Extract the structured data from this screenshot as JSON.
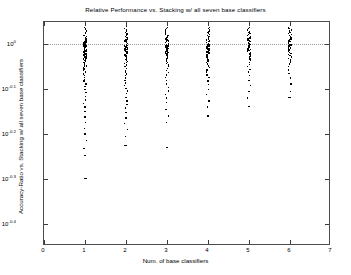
{
  "chart_data": {
    "type": "scatter",
    "title": "Relative Performance vs. Stacking w/ all seven base classifiers",
    "xlabel": "Num. of base classifiers",
    "ylabel": "Accuracy-Ratio vs. Stacking w/ all seven base classifiers",
    "yscale": "log",
    "xlim": [
      0,
      7
    ],
    "ylim_exponent": [
      -0.45,
      0.05
    ],
    "grid": false,
    "reference_line": {
      "y_exponent": 0.0,
      "style": "dotted",
      "label": "10^0"
    },
    "legend": null,
    "xticks": [
      0,
      1,
      2,
      3,
      4,
      5,
      6,
      7
    ],
    "xticklabels": [
      "0",
      "1",
      "2",
      "3",
      "4",
      "5",
      "6",
      "7"
    ],
    "yticks_exponent": [
      0,
      -0.1,
      -0.2,
      -0.3,
      -0.4
    ],
    "yticklabels": [
      "10",
      "10",
      "10",
      "10",
      "10"
    ],
    "ytick_superscripts": [
      "0",
      "-0.1",
      "-0.2",
      "-0.3",
      "-0.4"
    ],
    "series": [
      {
        "name": "1 base classifier",
        "x": 1,
        "y_exponents": [
          0.042,
          0.038,
          0.034,
          0.03,
          0.027,
          0.024,
          0.02,
          0.017,
          0.014,
          0.012,
          0.009,
          0.007,
          0.005,
          0.003,
          0.001,
          0.0,
          -0.001,
          -0.002,
          -0.003,
          -0.004,
          -0.005,
          -0.006,
          -0.007,
          -0.008,
          -0.009,
          -0.01,
          -0.011,
          -0.012,
          -0.013,
          -0.014,
          -0.015,
          -0.016,
          -0.017,
          -0.018,
          -0.019,
          -0.02,
          -0.021,
          -0.022,
          -0.023,
          -0.024,
          -0.025,
          -0.026,
          -0.027,
          -0.028,
          -0.029,
          -0.03,
          -0.031,
          -0.032,
          -0.033,
          -0.034,
          -0.035,
          -0.036,
          -0.038,
          -0.04,
          -0.042,
          -0.044,
          -0.046,
          -0.048,
          -0.05,
          -0.052,
          -0.055,
          -0.058,
          -0.062,
          -0.066,
          -0.07,
          -0.074,
          -0.078,
          -0.082,
          -0.088,
          -0.094,
          -0.1,
          -0.108,
          -0.116,
          -0.124,
          -0.132,
          -0.14,
          -0.15,
          -0.162,
          -0.175,
          -0.188,
          -0.2,
          -0.215,
          -0.232,
          -0.248,
          -0.3
        ],
        "outliers_y_exponents": [
          -0.3
        ]
      },
      {
        "name": "2 base classifiers",
        "x": 2,
        "y_exponents": [
          0.04,
          0.036,
          0.032,
          0.029,
          0.026,
          0.023,
          0.02,
          0.017,
          0.015,
          0.012,
          0.01,
          0.008,
          0.006,
          0.004,
          0.002,
          0.0,
          -0.001,
          -0.002,
          -0.003,
          -0.004,
          -0.005,
          -0.006,
          -0.007,
          -0.008,
          -0.009,
          -0.01,
          -0.011,
          -0.012,
          -0.013,
          -0.014,
          -0.015,
          -0.016,
          -0.017,
          -0.018,
          -0.019,
          -0.02,
          -0.021,
          -0.022,
          -0.023,
          -0.024,
          -0.026,
          -0.028,
          -0.03,
          -0.032,
          -0.034,
          -0.036,
          -0.038,
          -0.04,
          -0.043,
          -0.046,
          -0.05,
          -0.054,
          -0.058,
          -0.062,
          -0.066,
          -0.07,
          -0.075,
          -0.08,
          -0.086,
          -0.092,
          -0.098,
          -0.104,
          -0.11,
          -0.118,
          -0.126,
          -0.134,
          -0.142,
          -0.152,
          -0.164,
          -0.176,
          -0.19,
          -0.205,
          -0.225
        ],
        "outliers_y_exponents": [
          -0.225
        ]
      },
      {
        "name": "3 base classifiers",
        "x": 3,
        "y_exponents": [
          0.038,
          0.035,
          0.032,
          0.029,
          0.026,
          0.023,
          0.02,
          0.018,
          0.016,
          0.014,
          0.012,
          0.01,
          0.008,
          0.006,
          0.004,
          0.002,
          0.0,
          -0.001,
          -0.002,
          -0.003,
          -0.004,
          -0.005,
          -0.006,
          -0.007,
          -0.008,
          -0.009,
          -0.01,
          -0.011,
          -0.012,
          -0.013,
          -0.014,
          -0.015,
          -0.016,
          -0.017,
          -0.018,
          -0.019,
          -0.02,
          -0.021,
          -0.022,
          -0.024,
          -0.026,
          -0.028,
          -0.03,
          -0.032,
          -0.034,
          -0.037,
          -0.04,
          -0.043,
          -0.046,
          -0.05,
          -0.054,
          -0.058,
          -0.063,
          -0.068,
          -0.074,
          -0.08,
          -0.088,
          -0.096,
          -0.104,
          -0.112,
          -0.12,
          -0.13,
          -0.145,
          -0.16,
          -0.175
        ],
        "outliers_y_exponents": [
          -0.23
        ]
      },
      {
        "name": "4 base classifiers",
        "x": 4,
        "y_exponents": [
          0.038,
          0.035,
          0.032,
          0.029,
          0.027,
          0.024,
          0.022,
          0.02,
          0.018,
          0.016,
          0.014,
          0.012,
          0.01,
          0.008,
          0.006,
          0.004,
          0.002,
          0.0,
          -0.001,
          -0.002,
          -0.003,
          -0.004,
          -0.005,
          -0.006,
          -0.007,
          -0.008,
          -0.009,
          -0.01,
          -0.011,
          -0.012,
          -0.013,
          -0.014,
          -0.015,
          -0.016,
          -0.017,
          -0.018,
          -0.019,
          -0.02,
          -0.022,
          -0.024,
          -0.026,
          -0.028,
          -0.031,
          -0.034,
          -0.037,
          -0.04,
          -0.044,
          -0.048,
          -0.052,
          -0.057,
          -0.062,
          -0.068,
          -0.074,
          -0.082,
          -0.09,
          -0.1,
          -0.112,
          -0.126,
          -0.14,
          -0.16
        ],
        "outliers_y_exponents": [
          -0.16
        ]
      },
      {
        "name": "5 base classifiers",
        "x": 5,
        "y_exponents": [
          0.038,
          0.035,
          0.032,
          0.029,
          0.026,
          0.024,
          0.022,
          0.02,
          0.018,
          0.016,
          0.014,
          0.012,
          0.01,
          0.008,
          0.006,
          0.004,
          0.002,
          0.0,
          -0.001,
          -0.002,
          -0.003,
          -0.004,
          -0.005,
          -0.006,
          -0.007,
          -0.008,
          -0.009,
          -0.01,
          -0.011,
          -0.012,
          -0.013,
          -0.014,
          -0.015,
          -0.016,
          -0.018,
          -0.02,
          -0.022,
          -0.024,
          -0.027,
          -0.03,
          -0.033,
          -0.036,
          -0.04,
          -0.045,
          -0.05,
          -0.056,
          -0.062,
          -0.07,
          -0.08,
          -0.092,
          -0.105,
          -0.12,
          -0.138
        ],
        "outliers_y_exponents": [
          -0.138
        ]
      },
      {
        "name": "6 base classifiers",
        "x": 6,
        "y_exponents": [
          0.038,
          0.035,
          0.032,
          0.03,
          0.027,
          0.025,
          0.022,
          0.02,
          0.018,
          0.016,
          0.014,
          0.012,
          0.01,
          0.008,
          0.006,
          0.004,
          0.002,
          0.0,
          -0.001,
          -0.002,
          -0.003,
          -0.004,
          -0.005,
          -0.006,
          -0.007,
          -0.008,
          -0.009,
          -0.01,
          -0.011,
          -0.012,
          -0.013,
          -0.014,
          -0.016,
          -0.018,
          -0.02,
          -0.022,
          -0.025,
          -0.028,
          -0.031,
          -0.035,
          -0.039,
          -0.044,
          -0.05,
          -0.057,
          -0.065,
          -0.075,
          -0.088,
          -0.105,
          -0.118
        ],
        "outliers_y_exponents": [
          -0.118
        ]
      }
    ]
  }
}
